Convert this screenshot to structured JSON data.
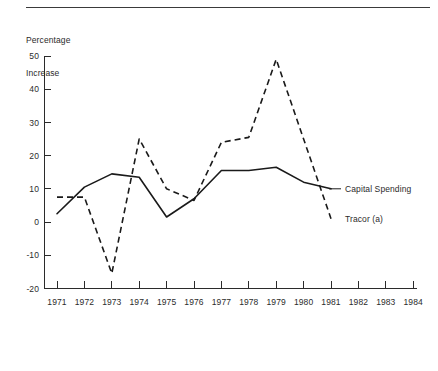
{
  "figure": {
    "axis_title_line1": "Percentage",
    "axis_title_line2": "Increase",
    "has_top_rule": true,
    "background_color": "#ffffff",
    "ink_color": "#1a1a1a"
  },
  "chart_data": {
    "type": "line",
    "title": "",
    "subtitle": "",
    "xlabel": "",
    "ylabel": "Percentage Increase",
    "x": [
      1971,
      1972,
      1973,
      1974,
      1975,
      1976,
      1977,
      1978,
      1979,
      1980,
      1981
    ],
    "xlim": [
      1971,
      1984
    ],
    "ylim": [
      -20,
      50
    ],
    "xticks": [
      "1971",
      "1972",
      "1973",
      "1974",
      "1975",
      "1976",
      "1977",
      "1978",
      "1979",
      "1980",
      "1981",
      "1982",
      "1983",
      "1984"
    ],
    "yticks": [
      "-20",
      "-10",
      "0",
      "10",
      "20",
      "30",
      "40",
      "50"
    ],
    "grid": false,
    "legend_position": "right-inline-labels",
    "series": [
      {
        "name": "Capital Spending",
        "style": "solid",
        "values": [
          2.5,
          10.5,
          14.5,
          13.5,
          1.5,
          7,
          15.5,
          15.5,
          16.5,
          12,
          10
        ]
      },
      {
        "name": "Tracor (a)",
        "style": "dashed",
        "values": [
          7.5,
          7.5,
          -15.5,
          25,
          10,
          6.5,
          24,
          25.5,
          49,
          25,
          1
        ]
      }
    ],
    "annotations": [
      {
        "text": "Capital Spending",
        "series": "Capital Spending",
        "at_x": 1981
      },
      {
        "text": "Tracor (a)",
        "series": "Tracor (a)",
        "at_x": 1981
      }
    ]
  }
}
